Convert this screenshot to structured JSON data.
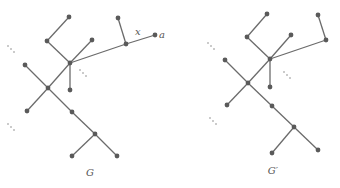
{
  "graphs": [
    {
      "id": "G",
      "label": "G",
      "label_pos": [
        90,
        176
      ],
      "nodes": {
        "t1": [
          69,
          17
        ],
        "n2": [
          47,
          41
        ],
        "n3": [
          92,
          40
        ],
        "hub": [
          70,
          63
        ],
        "left": [
          25,
          65
        ],
        "center": [
          48,
          88
        ],
        "n7": [
          70,
          90
        ],
        "n8": [
          27,
          111
        ],
        "n9": [
          72,
          112
        ],
        "n10": [
          95,
          134
        ],
        "n11": [
          72,
          156
        ],
        "n12": [
          117,
          156
        ],
        "tr": [
          118,
          18
        ],
        "x": [
          126,
          44
        ],
        "a": [
          155,
          35
        ]
      },
      "edges": [
        [
          "t1",
          "n2"
        ],
        [
          "n2",
          "hub"
        ],
        [
          "n3",
          "hub"
        ],
        [
          "hub",
          "n7"
        ],
        [
          "hub",
          "center"
        ],
        [
          "left",
          "center"
        ],
        [
          "center",
          "n8"
        ],
        [
          "center",
          "n9"
        ],
        [
          "n9",
          "n10"
        ],
        [
          "n10",
          "n11"
        ],
        [
          "n10",
          "n12"
        ],
        [
          "hub",
          "x"
        ],
        [
          "x",
          "tr"
        ],
        [
          "x",
          "a"
        ]
      ],
      "edge_labels": [
        {
          "text": "x",
          "pos": [
            135,
            35
          ]
        }
      ],
      "node_labels": [
        {
          "text": "a",
          "pos": [
            159,
            38
          ]
        }
      ],
      "ellipses": [
        [
          8,
          46
        ],
        [
          80,
          70
        ],
        [
          8,
          124
        ]
      ]
    },
    {
      "id": "G-prime",
      "label": "G′",
      "label_pos": [
        273,
        174
      ],
      "nodes": {
        "t1": [
          267,
          14
        ],
        "n2": [
          247,
          37
        ],
        "n3": [
          291,
          35
        ],
        "hub": [
          270,
          59
        ],
        "left": [
          225,
          60
        ],
        "center": [
          248,
          83
        ],
        "n7": [
          270,
          87
        ],
        "n8": [
          227,
          105
        ],
        "n9": [
          272,
          106
        ],
        "n10": [
          294,
          127
        ],
        "n11": [
          272,
          153
        ],
        "n12": [
          318,
          150
        ],
        "tr": [
          318,
          15
        ],
        "r": [
          326,
          40
        ]
      },
      "edges": [
        [
          "t1",
          "n2"
        ],
        [
          "n2",
          "hub"
        ],
        [
          "n3",
          "hub"
        ],
        [
          "hub",
          "n7"
        ],
        [
          "hub",
          "center"
        ],
        [
          "left",
          "center"
        ],
        [
          "center",
          "n8"
        ],
        [
          "center",
          "n9"
        ],
        [
          "n9",
          "n10"
        ],
        [
          "n10",
          "n11"
        ],
        [
          "n10",
          "n12"
        ],
        [
          "hub",
          "r"
        ],
        [
          "r",
          "tr"
        ]
      ],
      "edge_labels": [],
      "node_labels": [],
      "ellipses": [
        [
          208,
          43
        ],
        [
          284,
          72
        ],
        [
          210,
          118
        ]
      ]
    }
  ]
}
